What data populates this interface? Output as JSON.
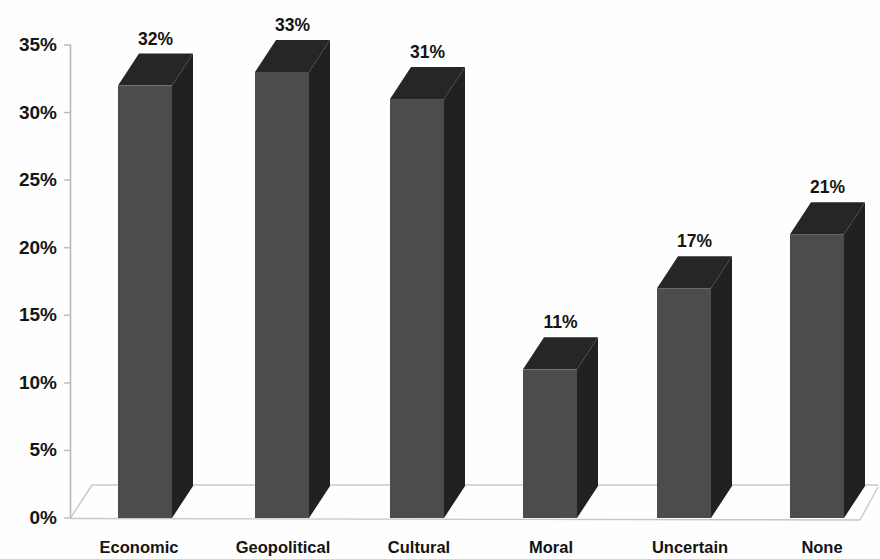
{
  "chart_data": {
    "type": "bar",
    "title": "",
    "subtitle": "",
    "xlabel": "",
    "ylabel": "",
    "categories": [
      "Economic",
      "Geopolitical",
      "Cultural",
      "Moral",
      "Uncertain",
      "None"
    ],
    "values": [
      32,
      33,
      31,
      11,
      17,
      21
    ],
    "data_labels": [
      "32%",
      "33%",
      "31%",
      "11%",
      "17%",
      "21%"
    ],
    "ylim": [
      0,
      35
    ],
    "ytick_values": [
      0,
      5,
      10,
      15,
      20,
      25,
      30,
      35
    ],
    "ytick_labels": [
      "0%",
      "5%",
      "10%",
      "15%",
      "20%",
      "25%",
      "30%",
      "35%"
    ],
    "grid": false,
    "legend": null,
    "style": "3d-column",
    "series": [
      {
        "name": "Share of respondents",
        "values": [
          32,
          33,
          31,
          11,
          17,
          21
        ]
      }
    ],
    "colors": {
      "bar_front": "#4c4c4c",
      "bar_top": "#262626",
      "bar_side": "#212121",
      "axis": "#b9b9b9",
      "text": "#141414",
      "background": "#fefefe"
    }
  }
}
